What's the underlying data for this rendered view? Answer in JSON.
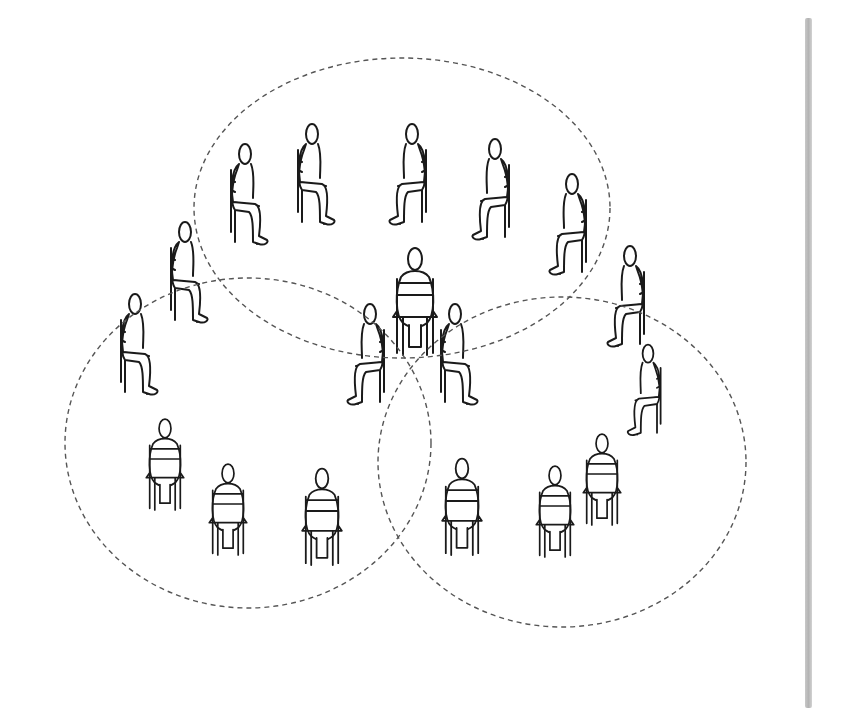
{
  "diagram": {
    "stroke_color": "#1a1a1a",
    "dash_color": "#555555",
    "background": "#ffffff",
    "scrollbar_color": "#bdbdbd",
    "circles": [
      {
        "name": "top-group",
        "cx": 402,
        "cy": 208,
        "rx": 208,
        "ry": 150
      },
      {
        "name": "left-group",
        "cx": 248,
        "cy": 443,
        "rx": 183,
        "ry": 165
      },
      {
        "name": "right-group",
        "cx": 562,
        "cy": 462,
        "rx": 184,
        "ry": 165
      }
    ],
    "figures": [
      {
        "x": 245,
        "y": 150,
        "pose": "side",
        "facing": "right",
        "scale": 1.0
      },
      {
        "x": 312,
        "y": 130,
        "pose": "side",
        "facing": "right",
        "scale": 1.0
      },
      {
        "x": 412,
        "y": 130,
        "pose": "side",
        "facing": "left",
        "scale": 1.0
      },
      {
        "x": 495,
        "y": 145,
        "pose": "side",
        "facing": "left",
        "scale": 1.0
      },
      {
        "x": 572,
        "y": 180,
        "pose": "side",
        "facing": "left",
        "scale": 1.0
      },
      {
        "x": 185,
        "y": 228,
        "pose": "side",
        "facing": "right",
        "scale": 1.0
      },
      {
        "x": 135,
        "y": 300,
        "pose": "side",
        "facing": "right",
        "scale": 1.0
      },
      {
        "x": 415,
        "y": 255,
        "pose": "back",
        "facing": "up",
        "scale": 1.0
      },
      {
        "x": 370,
        "y": 310,
        "pose": "side",
        "facing": "left",
        "scale": 1.0
      },
      {
        "x": 455,
        "y": 310,
        "pose": "side",
        "facing": "right",
        "scale": 1.0
      },
      {
        "x": 630,
        "y": 252,
        "pose": "side",
        "facing": "left",
        "scale": 1.0
      },
      {
        "x": 648,
        "y": 350,
        "pose": "side",
        "facing": "left",
        "scale": 0.9
      },
      {
        "x": 165,
        "y": 425,
        "pose": "back",
        "facing": "up",
        "scale": 0.85
      },
      {
        "x": 228,
        "y": 470,
        "pose": "back",
        "facing": "up",
        "scale": 0.85
      },
      {
        "x": 322,
        "y": 475,
        "pose": "back",
        "facing": "up",
        "scale": 0.9
      },
      {
        "x": 462,
        "y": 465,
        "pose": "back",
        "facing": "up",
        "scale": 0.9
      },
      {
        "x": 555,
        "y": 472,
        "pose": "back",
        "facing": "up",
        "scale": 0.85
      },
      {
        "x": 602,
        "y": 440,
        "pose": "back",
        "facing": "up",
        "scale": 0.85
      }
    ]
  }
}
